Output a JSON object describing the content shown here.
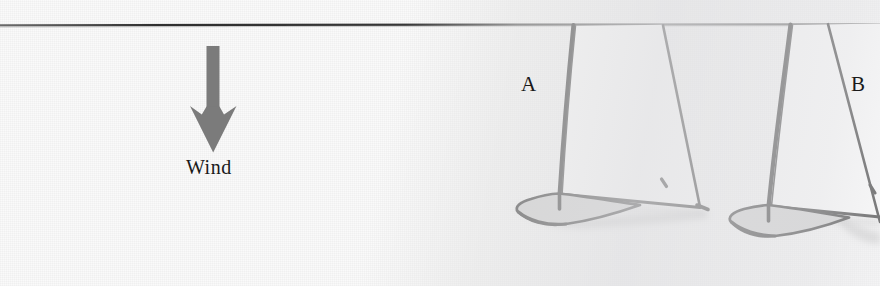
{
  "figure": {
    "caption_labels": {
      "wind": "Wind",
      "boat_a": "A",
      "boat_b": "B"
    },
    "colors": {
      "background": "#fafafa",
      "shade": "#e4e4e6",
      "ink": "#1a1a1a",
      "arrow": "#7a7a7a",
      "hull_fill": "#c9c9c9",
      "sail_fill": "#ffffff",
      "rule_line": "#3a3a3a"
    },
    "elements": {
      "top_rule": {
        "name": "horizontal-rule",
        "y": 25
      },
      "wind_arrow": {
        "name": "wind-arrow",
        "direction": "down",
        "shaft_x": 213,
        "shaft_top": 47,
        "shaft_bottom": 108,
        "tip_y": 152
      },
      "boats": [
        {
          "id": "A",
          "name": "sailboat-a",
          "mast_top_x": 573,
          "mast_base_x": 559,
          "hull_center_x": 571,
          "hull_base_y": 212,
          "label_x": 521,
          "label_y": 72
        },
        {
          "id": "B",
          "name": "sailboat-b",
          "mast_top_x": 790,
          "mast_base_x": 768,
          "hull_center_x": 782,
          "hull_base_y": 222,
          "label_x": 851,
          "label_y": 72
        }
      ]
    }
  }
}
